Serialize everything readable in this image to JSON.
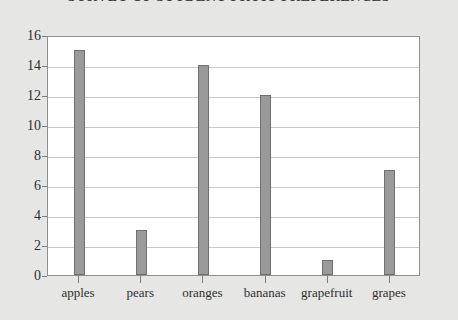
{
  "chart_data": {
    "type": "bar",
    "title": "SURVEY OF STUDENT FRUIT PREFERENCES",
    "xlabel": "",
    "ylabel": "",
    "categories": [
      "apples",
      "pears",
      "oranges",
      "bananas",
      "grapefruit",
      "grapes"
    ],
    "values": [
      15,
      3,
      14,
      12,
      1,
      7
    ],
    "ylim": [
      0,
      16
    ],
    "yticks": [
      0,
      2,
      4,
      6,
      8,
      10,
      12,
      14,
      16
    ],
    "ytick_labels": [
      "0",
      "2",
      "4",
      "6",
      "8",
      "10",
      "12",
      "14",
      "16"
    ],
    "grid": true,
    "legend": false,
    "series": [
      {
        "name": "responses",
        "values": [
          15,
          3,
          14,
          12,
          1,
          7
        ]
      }
    ],
    "colors": {
      "bar_fill": "#9a9a9a",
      "bar_border": "#6f6f6f",
      "plot_background": "#ffffff",
      "page_background": "#e6e6e4",
      "gridline": "#c9c9c9",
      "axis": "#8f8f8f",
      "text": "#2f2f2f"
    }
  }
}
